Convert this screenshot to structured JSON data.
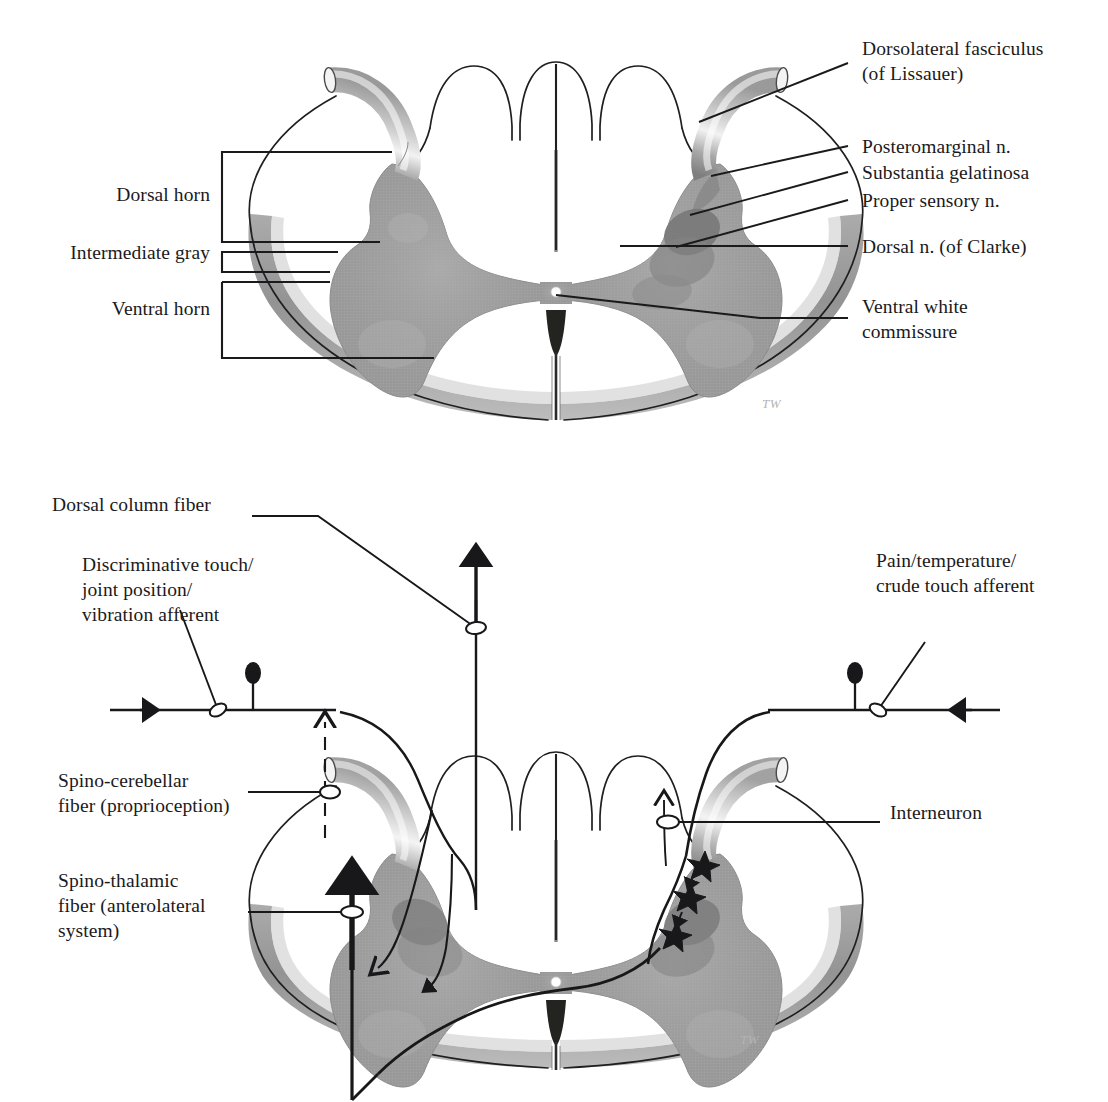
{
  "figure": {
    "kind": "anatomical-illustration",
    "artist_signature": "TW"
  },
  "palette": {
    "ink": "#1a1a1c",
    "gray_matter": "#9c9c9c",
    "gray_matter_dark": "#868686",
    "substantia_gelatinosa": "#7b7b7b",
    "posteromarginal": "#8d8d8d",
    "proper_sensory": "#7f7f7f",
    "clarke": "#8a8a8a",
    "white_matter": "#ffffff",
    "surface_rim": "#8f8f8f",
    "root_light": "#e8e8e8",
    "root_mid": "#bdbdbd",
    "root_dark": "#8a8a8a",
    "signature": "#b4b4b4"
  },
  "panel_top": {
    "title": "Laminar organization of spinal gray matter",
    "left_labels": [
      {
        "id": "dorsal-horn",
        "text": "Dorsal horn"
      },
      {
        "id": "intermediate-gray",
        "text": "Intermediate gray"
      },
      {
        "id": "ventral-horn",
        "text": "Ventral horn"
      }
    ],
    "right_labels": [
      {
        "id": "dorsolateral-fasciculus",
        "text": "Dorsolateral fasciculus\n(of Lissauer)"
      },
      {
        "id": "posteromarginal-n",
        "text": "Posteromarginal n."
      },
      {
        "id": "substantia-gelatinosa",
        "text": "Substantia gelatinosa"
      },
      {
        "id": "proper-sensory-n",
        "text": "Proper sensory n."
      },
      {
        "id": "dorsal-n-of-clarke",
        "text": "Dorsal n. (of Clarke)"
      },
      {
        "id": "ventral-white-commissure",
        "text": "Ventral white\ncommissure"
      }
    ]
  },
  "panel_bottom": {
    "title": "Primary afferent fibers and ascending pathways",
    "left_labels": [
      {
        "id": "dorsal-column-fiber",
        "text": "Dorsal column fiber"
      },
      {
        "id": "discriminative-touch-afferent",
        "text": "Discriminative touch/\njoint position/\nvibration afferent"
      },
      {
        "id": "spino-cerebellar-fiber",
        "text": "Spino-cerebellar\nfiber (proprioception)"
      },
      {
        "id": "spino-thalamic-fiber",
        "text": "Spino-thalamic\nfiber (anterolateral\nsystem)"
      }
    ],
    "right_labels": [
      {
        "id": "pain-temperature-afferent",
        "text": "Pain/temperature/\ncrude touch afferent"
      },
      {
        "id": "interneuron",
        "text": "Interneuron"
      }
    ]
  }
}
